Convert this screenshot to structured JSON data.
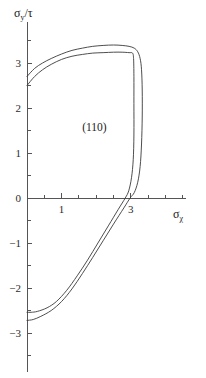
{
  "chart_data": {
    "type": "line",
    "title": "",
    "xlabel": "σχ",
    "ylabel": "σy/τ",
    "xlabel_base": "σ",
    "xlabel_sub": "χ",
    "ylabel_base": "σ",
    "ylabel_sub": "y",
    "ylabel_tail": "/τ",
    "annotation": "(110)",
    "annotation_x": 1.95,
    "annotation_y": 1.5,
    "grid": false,
    "legend": "none",
    "xlim": [
      -0.55,
      4.6
    ],
    "ylim": [
      -3.9,
      3.9
    ],
    "xticks_major": [
      1,
      3
    ],
    "xticks_major_labels": [
      "1",
      "3"
    ],
    "xticks_minor": [
      0,
      0.5,
      1.5,
      2,
      2.5,
      3.5,
      4,
      4.5
    ],
    "yticks_major": [
      -3,
      -2,
      -1,
      0,
      1,
      2,
      3
    ],
    "yticks_major_labels": [
      "−3",
      "−2",
      "−1",
      "0",
      "1",
      "2",
      "3"
    ],
    "yticks_minor": [
      -3.5,
      -2.5,
      -1.5,
      -0.5,
      0.5,
      1.5,
      2.5,
      3.5
    ],
    "series": [
      {
        "name": "outer-yield-locus",
        "points": [
          [
            0.0,
            2.7
          ],
          [
            0.22,
            2.88
          ],
          [
            0.45,
            3.0
          ],
          [
            0.7,
            3.1
          ],
          [
            1.0,
            3.2
          ],
          [
            1.3,
            3.28
          ],
          [
            1.6,
            3.33
          ],
          [
            1.9,
            3.37
          ],
          [
            2.2,
            3.39
          ],
          [
            2.5,
            3.4
          ],
          [
            2.75,
            3.39
          ],
          [
            2.95,
            3.37
          ],
          [
            3.1,
            3.33
          ],
          [
            3.2,
            3.25
          ],
          [
            3.27,
            3.1
          ],
          [
            3.31,
            2.85
          ],
          [
            3.33,
            2.4
          ],
          [
            3.33,
            1.8
          ],
          [
            3.31,
            1.2
          ],
          [
            3.27,
            0.7
          ],
          [
            3.2,
            0.35
          ],
          [
            3.1,
            0.12
          ],
          [
            2.98,
            0.0
          ],
          [
            2.8,
            -0.22
          ],
          [
            2.5,
            -0.58
          ],
          [
            2.2,
            -0.95
          ],
          [
            1.9,
            -1.32
          ],
          [
            1.6,
            -1.68
          ],
          [
            1.3,
            -2.02
          ],
          [
            1.0,
            -2.3
          ],
          [
            0.7,
            -2.5
          ],
          [
            0.4,
            -2.63
          ],
          [
            0.18,
            -2.7
          ],
          [
            0.0,
            -2.72
          ]
        ]
      },
      {
        "name": "inner-yield-locus",
        "points": [
          [
            0.0,
            2.5
          ],
          [
            0.22,
            2.7
          ],
          [
            0.45,
            2.85
          ],
          [
            0.7,
            2.97
          ],
          [
            1.0,
            3.08
          ],
          [
            1.3,
            3.15
          ],
          [
            1.6,
            3.19
          ],
          [
            1.9,
            3.22
          ],
          [
            2.2,
            3.23
          ],
          [
            2.5,
            3.24
          ],
          [
            2.75,
            3.24
          ],
          [
            2.95,
            3.23
          ],
          [
            3.05,
            3.22
          ],
          [
            3.08,
            3.1
          ],
          [
            3.09,
            2.7
          ],
          [
            3.09,
            2.1
          ],
          [
            3.09,
            1.4
          ],
          [
            3.07,
            0.85
          ],
          [
            3.02,
            0.45
          ],
          [
            2.94,
            0.16
          ],
          [
            2.84,
            0.0
          ],
          [
            2.64,
            -0.25
          ],
          [
            2.35,
            -0.62
          ],
          [
            2.05,
            -1.0
          ],
          [
            1.75,
            -1.38
          ],
          [
            1.45,
            -1.73
          ],
          [
            1.15,
            -2.05
          ],
          [
            0.85,
            -2.3
          ],
          [
            0.58,
            -2.44
          ],
          [
            0.3,
            -2.52
          ],
          [
            0.12,
            -2.54
          ],
          [
            0.0,
            -2.54
          ]
        ]
      }
    ]
  },
  "axes": {
    "y_axis_name": "vertical-axis",
    "x_axis_name": "horizontal-axis"
  }
}
